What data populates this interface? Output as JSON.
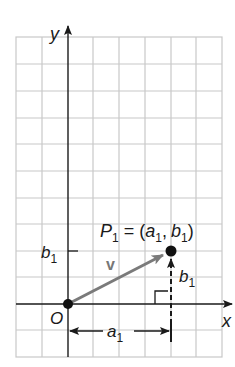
{
  "diagram": {
    "type": "vector-on-coordinate-grid",
    "axes": {
      "x_label": "x",
      "y_label": "y",
      "origin_label": "O"
    },
    "point": {
      "name": "P",
      "subscript": "1",
      "equals": "=",
      "coord_open": "(",
      "coord_a": "a",
      "coord_a_sub": "1",
      "coord_sep": ",",
      "coord_b": "b",
      "coord_b_sub": "1",
      "coord_close": ")"
    },
    "vector_label": "v",
    "y_tick_label": {
      "base": "b",
      "sub": "1"
    },
    "vertical_component_label": {
      "base": "b",
      "sub": "1"
    },
    "horizontal_component_label": {
      "base": "a",
      "sub": "1"
    },
    "colors": {
      "grid": "#c8c8c8",
      "axis": "#1a1a1a",
      "vector": "#7a7a7a",
      "point": "#111111"
    }
  }
}
